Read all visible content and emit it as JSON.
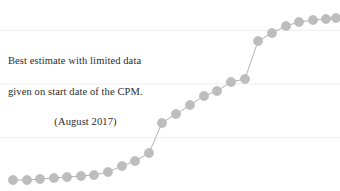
{
  "figure": {
    "width": 340,
    "height": 191,
    "background": "#ffffff"
  },
  "annotation": {
    "name": "cpm-estimate-note",
    "line1": "Best estimate with limited data",
    "line2": "given on start date of the CPM.",
    "line3": "(August 2017)",
    "color": "#2b2b2b"
  },
  "style": {
    "marker_color": "#bdbdbd",
    "marker_edge_color": "#b5b5b5",
    "line_color": "#a8a8a8",
    "gridline_color": "#efefef",
    "marker_radius": 4.6,
    "line_width": 0.9
  },
  "chart_data": {
    "type": "line",
    "title": "",
    "xlabel": "",
    "ylabel": "",
    "grid": true,
    "gridlines_y": [
      0.84,
      0.56,
      0.28
    ],
    "legend": "none",
    "annotations": [
      {
        "text": "Best estimate with limited data given on start date of the CPM. (August 2017)",
        "x": 0.04,
        "y": 0.72
      }
    ],
    "xlim": [
      0,
      1
    ],
    "ylim": [
      0,
      1
    ],
    "marker": "circle",
    "series": [
      {
        "name": "cumulative-progress",
        "x": [
          0.013,
          0.053,
          0.094,
          0.134,
          0.175,
          0.215,
          0.256,
          0.296,
          0.337,
          0.377,
          0.418,
          0.458,
          0.499,
          0.539,
          0.58,
          0.62,
          0.661,
          0.701,
          0.742,
          0.782,
          0.823,
          0.863,
          0.904,
          0.944,
          0.985
        ],
        "y": [
          0.058,
          0.058,
          0.06,
          0.063,
          0.068,
          0.073,
          0.079,
          0.095,
          0.126,
          0.157,
          0.199,
          0.356,
          0.404,
          0.451,
          0.499,
          0.525,
          0.572,
          0.588,
          0.785,
          0.827,
          0.863,
          0.884,
          0.895,
          0.9,
          0.905
        ],
        "points_px": [
          {
            "x": 13,
            "y": 180
          },
          {
            "x": 27,
            "y": 180
          },
          {
            "x": 40,
            "y": 179
          },
          {
            "x": 54,
            "y": 178
          },
          {
            "x": 67,
            "y": 177
          },
          {
            "x": 81,
            "y": 176
          },
          {
            "x": 94,
            "y": 175
          },
          {
            "x": 108,
            "y": 172
          },
          {
            "x": 122,
            "y": 166
          },
          {
            "x": 135,
            "y": 161
          },
          {
            "x": 149,
            "y": 153
          },
          {
            "x": 162,
            "y": 123
          },
          {
            "x": 176,
            "y": 114
          },
          {
            "x": 190,
            "y": 105
          },
          {
            "x": 204,
            "y": 96
          },
          {
            "x": 217,
            "y": 91
          },
          {
            "x": 231,
            "y": 82
          },
          {
            "x": 245,
            "y": 79
          },
          {
            "x": 258,
            "y": 41
          },
          {
            "x": 272,
            "y": 33
          },
          {
            "x": 286,
            "y": 26
          },
          {
            "x": 299,
            "y": 22
          },
          {
            "x": 313,
            "y": 20
          },
          {
            "x": 326,
            "y": 19
          },
          {
            "x": 336,
            "y": 18
          }
        ]
      }
    ]
  }
}
